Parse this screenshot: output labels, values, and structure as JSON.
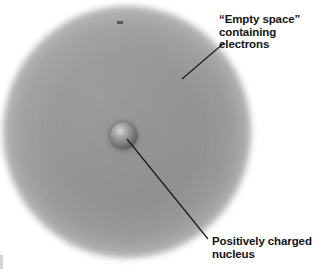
{
  "figure": {
    "background_color": "#ffffff"
  },
  "diagram": {
    "cloud": {
      "name": "electron cloud",
      "color": "#8c8c8c"
    },
    "nucleus": {
      "name": "nucleus",
      "color": "#5e5e5e"
    },
    "line_color": "#1a1a1a"
  },
  "labels": {
    "empty_space": {
      "line1": "“Empty space”",
      "line2": "containing",
      "line3": "electrons"
    },
    "nucleus": {
      "line1": "Positively charged",
      "line2": "nucleus"
    }
  }
}
